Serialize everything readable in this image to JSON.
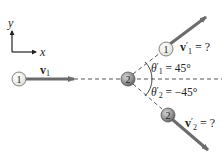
{
  "axes": {
    "x_label": "x",
    "y_label": "y"
  },
  "particles": {
    "p1_initial": {
      "label": "1"
    },
    "p2_target": {
      "label": "2"
    },
    "p1_final": {
      "label": "1"
    },
    "p2_final": {
      "label": "2"
    }
  },
  "vectors": {
    "v1": {
      "symbol": "v",
      "sub": "1"
    },
    "v1_prime": {
      "symbol": "v",
      "prime": "′",
      "sub": "1",
      "value": " = ?"
    },
    "v2_prime": {
      "symbol": "v",
      "prime": "′",
      "sub": "2",
      "value": " = ?"
    }
  },
  "angles": {
    "theta1": {
      "symbol": "θ",
      "prime": "′",
      "sub": "1",
      "value": " = 45°"
    },
    "theta2": {
      "symbol": "θ",
      "prime": "′",
      "sub": "2",
      "value": " = −45°"
    }
  },
  "colors": {
    "arrow": "#6b6b6b",
    "ball_light": "#f2f2ee",
    "ball_dark": "#8a8a8a",
    "dashed": "#555555"
  }
}
